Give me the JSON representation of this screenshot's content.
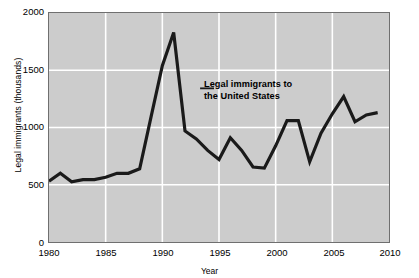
{
  "chart_data": {
    "type": "line",
    "title": "",
    "xlabel": "Year",
    "ylabel": "Legal immigrants (thousands)",
    "xlim": [
      1980,
      2010
    ],
    "ylim": [
      0,
      2000
    ],
    "xticks": [
      1980,
      1985,
      1990,
      1995,
      2000,
      2005,
      2010
    ],
    "yticks": [
      0,
      500,
      1000,
      1500,
      2000
    ],
    "grid": "white gridlines at each major tick, inside gray plot area",
    "legend": "none (inline annotation)",
    "annotation": {
      "line1": "Legal immigrants to",
      "line2": "the United States",
      "leader_line": true
    },
    "series": [
      {
        "name": "Legal immigrants to the United States",
        "color": "#1a1a1a",
        "x": [
          1980,
          1981,
          1982,
          1983,
          1984,
          1985,
          1986,
          1987,
          1988,
          1989,
          1990,
          1991,
          1992,
          1993,
          1994,
          1995,
          1996,
          1997,
          1998,
          1999,
          2000,
          2001,
          2002,
          2003,
          2004,
          2005,
          2006,
          2007,
          2008,
          2009
        ],
        "values": [
          530,
          600,
          525,
          545,
          545,
          565,
          600,
          600,
          640,
          1090,
          1540,
          1830,
          970,
          900,
          800,
          720,
          910,
          800,
          655,
          645,
          840,
          1060,
          1060,
          700,
          950,
          1120,
          1270,
          1050,
          1110,
          1130
        ]
      }
    ]
  },
  "axes": {
    "y_tick_labels": [
      "2000",
      "1500",
      "1000",
      "500",
      "0"
    ],
    "x_tick_labels": [
      "1980",
      "1985",
      "1990",
      "1995",
      "2000",
      "2005",
      "2010"
    ],
    "y_axis_title": "Legal immigrants (thousands)",
    "x_axis_title": "Year"
  },
  "colors": {
    "plot_background": "#cccccc",
    "gridline": "#ffffff",
    "frame": "#6f6f6f",
    "data_line": "#1a1a1a",
    "page_background": "#ffffff",
    "text": "#000000"
  }
}
